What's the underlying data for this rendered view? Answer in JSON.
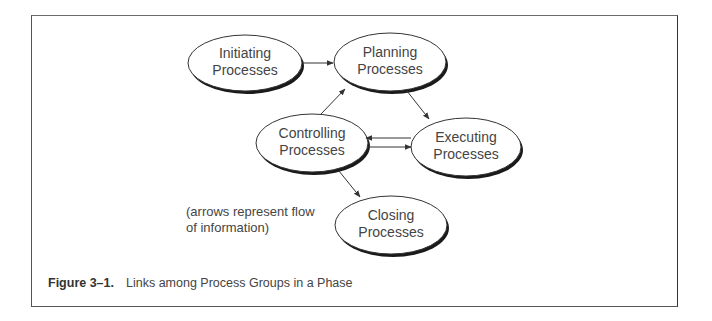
{
  "diagram": {
    "nodes": [
      {
        "id": "initiating",
        "line1": "Initiating",
        "line2": "Processes",
        "cx": 245,
        "cy": 63,
        "rx": 57,
        "ry": 28
      },
      {
        "id": "planning",
        "line1": "Planning",
        "line2": "Processes",
        "cx": 390,
        "cy": 62,
        "rx": 56,
        "ry": 29
      },
      {
        "id": "controlling",
        "line1": "Controlling",
        "line2": "Processes",
        "cx": 312,
        "cy": 143,
        "rx": 56,
        "ry": 29
      },
      {
        "id": "executing",
        "line1": "Executing",
        "line2": "Processes",
        "cx": 466,
        "cy": 147,
        "rx": 55,
        "ry": 29
      },
      {
        "id": "closing",
        "line1": "Closing",
        "line2": "Processes",
        "cx": 391,
        "cy": 225,
        "rx": 56,
        "ry": 29
      }
    ],
    "edges": [
      {
        "from": "initiating",
        "to": "planning"
      },
      {
        "from": "planning",
        "to": "executing"
      },
      {
        "from": "executing",
        "to": "controlling"
      },
      {
        "from": "controlling",
        "to": "executing"
      },
      {
        "from": "controlling",
        "to": "planning"
      },
      {
        "from": "controlling",
        "to": "closing"
      }
    ],
    "annotation": {
      "line1": "(arrows represent flow",
      "line2": "of information)"
    }
  },
  "caption": {
    "figure_number": "Figure 3–1.",
    "text": "Links among Process Groups in a Phase"
  },
  "colors": {
    "stroke": "#333333",
    "shadow": "#1a1a1a",
    "text": "#444444",
    "frame": "#555555"
  }
}
